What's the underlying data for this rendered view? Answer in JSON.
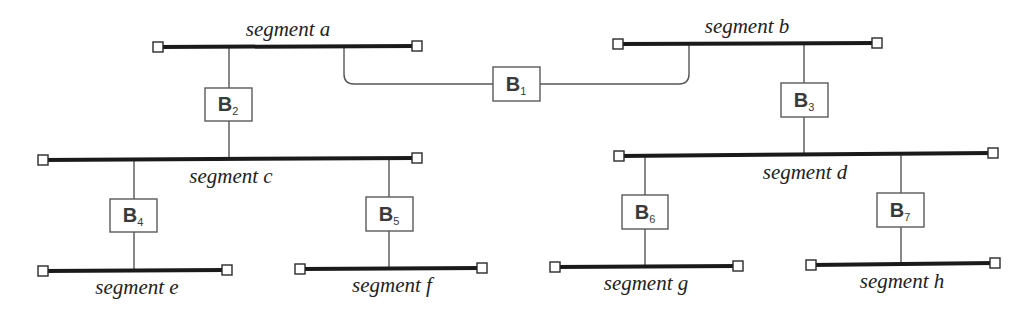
{
  "diagram": {
    "type": "bridged-lan-topology",
    "colors": {
      "segment_line": "#1a1a1a",
      "connector": "#555555",
      "bridge_border": "#5a5a5a",
      "text": "#222222",
      "background": "#ffffff"
    },
    "segments": [
      {
        "id": "a",
        "label": "segment a"
      },
      {
        "id": "b",
        "label": "segment b"
      },
      {
        "id": "c",
        "label": "segment c"
      },
      {
        "id": "d",
        "label": "segment d"
      },
      {
        "id": "e",
        "label": "segment e"
      },
      {
        "id": "f",
        "label": "segment f"
      },
      {
        "id": "g",
        "label": "segment g"
      },
      {
        "id": "h",
        "label": "segment h"
      }
    ],
    "bridges": [
      {
        "id": "B1",
        "letter": "B",
        "sub": "1",
        "connects": [
          "a",
          "b"
        ]
      },
      {
        "id": "B2",
        "letter": "B",
        "sub": "2",
        "connects": [
          "a",
          "c"
        ]
      },
      {
        "id": "B3",
        "letter": "B",
        "sub": "3",
        "connects": [
          "b",
          "d"
        ]
      },
      {
        "id": "B4",
        "letter": "B",
        "sub": "4",
        "connects": [
          "c",
          "e"
        ]
      },
      {
        "id": "B5",
        "letter": "B",
        "sub": "5",
        "connects": [
          "c",
          "f"
        ]
      },
      {
        "id": "B6",
        "letter": "B",
        "sub": "6",
        "connects": [
          "d",
          "g"
        ]
      },
      {
        "id": "B7",
        "letter": "B",
        "sub": "7",
        "connects": [
          "d",
          "h"
        ]
      }
    ]
  }
}
